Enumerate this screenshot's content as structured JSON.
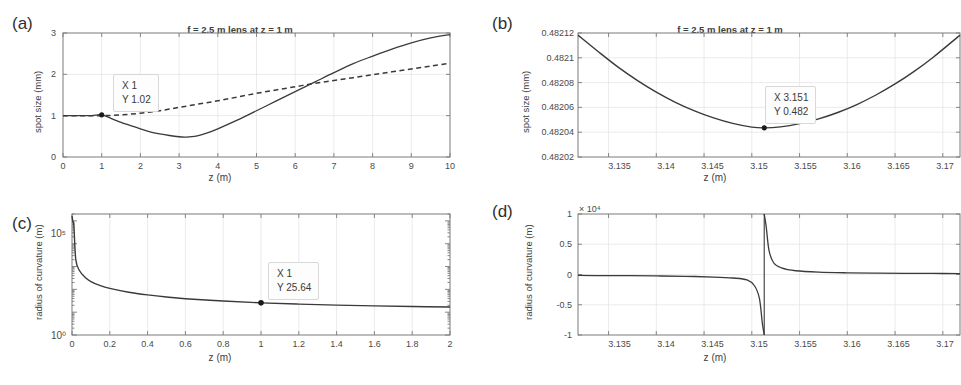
{
  "figure": {
    "panels": [
      {
        "id": "a",
        "label": "(a)",
        "title": "f = 2.5 m lens at z = 1 m",
        "xlabel": "z (m)",
        "ylabel": "spot size (mm)",
        "xticks": [
          "0",
          "1",
          "2",
          "3",
          "4",
          "5",
          "6",
          "7",
          "8",
          "9",
          "10"
        ],
        "yticks": [
          "0",
          "1",
          "2",
          "3"
        ],
        "datatip": {
          "x_line": "X 1",
          "y_line": "Y 1.02"
        }
      },
      {
        "id": "b",
        "label": "(b)",
        "title": "f = 2.5 m lens at z = 1 m",
        "xlabel": "z (m)",
        "ylabel": "spot size (mm)",
        "xticks": [
          "3.135",
          "3.14",
          "3.145",
          "3.15",
          "3.155",
          "3.16",
          "3.165",
          "3.17"
        ],
        "yticks": [
          "0.48202",
          "0.48204",
          "0.48206",
          "0.48208",
          "0.4821",
          "0.48212"
        ],
        "datatip": {
          "x_line": "X 3.151",
          "y_line": "Y 0.482"
        }
      },
      {
        "id": "c",
        "label": "(c)",
        "title": "",
        "xlabel": "z (m)",
        "ylabel": "radius of curvature (m)",
        "xticks": [
          "0",
          "0.2",
          "0.4",
          "0.6",
          "0.8",
          "1",
          "1.2",
          "1.4",
          "1.6",
          "1.8",
          "2"
        ],
        "yticks": [
          "10⁰",
          "10⁵"
        ],
        "datatip": {
          "x_line": "X 1",
          "y_line": "Y 25.64"
        }
      },
      {
        "id": "d",
        "label": "(d)",
        "title": "",
        "xlabel": "z (m)",
        "ylabel": "radius of curvature (m)",
        "xticks": [
          "3.135",
          "3.14",
          "3.145",
          "3.15",
          "3.155",
          "3.16",
          "3.165",
          "3.17"
        ],
        "yticks": [
          "-1",
          "-0.5",
          "0",
          "0.5",
          "1"
        ],
        "exponent": "× 10⁴",
        "datatip": null
      }
    ]
  },
  "chart_data": [
    {
      "type": "line",
      "panel": "a",
      "title": "f = 2.5 m lens at z = 1 m",
      "xlabel": "z (m)",
      "ylabel": "spot size (mm)",
      "xlim": [
        0,
        10
      ],
      "ylim": [
        0,
        3
      ],
      "xticks": [
        0,
        1,
        2,
        3,
        4,
        5,
        6,
        7,
        8,
        9,
        10
      ],
      "yticks": [
        0,
        1,
        2,
        3
      ],
      "grid": true,
      "legend": null,
      "annotations": [
        {
          "text": "X 1 / Y 1.02",
          "x": 1,
          "y": 1.02,
          "marker": true
        }
      ],
      "series": [
        {
          "name": "focused beam (with lens)",
          "style": "solid",
          "x": [
            0,
            0.25,
            0.5,
            0.75,
            1.0,
            1.25,
            1.5,
            1.75,
            2.0,
            2.25,
            2.5,
            2.75,
            3.0,
            3.151,
            3.25,
            3.5,
            3.75,
            4.0,
            4.5,
            5.0,
            5.5,
            6.0,
            6.5,
            7.0,
            7.5,
            8.0,
            8.5,
            9.0,
            9.5,
            10.0
          ],
          "y": [
            1.0,
            1.0,
            1.0,
            1.0,
            1.02,
            0.93,
            0.84,
            0.76,
            0.68,
            0.61,
            0.56,
            0.52,
            0.49,
            0.482,
            0.485,
            0.52,
            0.59,
            0.68,
            0.89,
            1.12,
            1.35,
            1.58,
            1.81,
            2.04,
            2.26,
            2.44,
            2.61,
            2.76,
            2.88,
            2.96
          ]
        },
        {
          "name": "free propagation (no lens)",
          "style": "dashed",
          "x": [
            0,
            0.5,
            1.0,
            1.5,
            2.0,
            2.5,
            3.0,
            3.5,
            4.0,
            4.5,
            5.0,
            5.5,
            6.0,
            6.5,
            7.0,
            7.5,
            8.0,
            8.5,
            9.0,
            9.5,
            10.0
          ],
          "y": [
            1.0,
            1.0,
            1.0,
            1.02,
            1.06,
            1.12,
            1.2,
            1.28,
            1.36,
            1.45,
            1.54,
            1.62,
            1.7,
            1.78,
            1.85,
            1.92,
            1.99,
            2.06,
            2.13,
            2.2,
            2.27
          ]
        }
      ]
    },
    {
      "type": "line",
      "panel": "b",
      "title": "f = 2.5 m lens at z = 1 m",
      "xlabel": "z (m)",
      "ylabel": "spot size (mm)",
      "xlim": [
        3.1318,
        3.1718
      ],
      "ylim": [
        0.48202,
        0.48212
      ],
      "xticks": [
        3.135,
        3.14,
        3.145,
        3.15,
        3.155,
        3.16,
        3.165,
        3.17
      ],
      "yticks": [
        0.48202,
        0.48204,
        0.48206,
        0.48208,
        0.4821,
        0.48212
      ],
      "grid": true,
      "legend": null,
      "annotations": [
        {
          "text": "X 3.151 / Y 0.482",
          "x": 3.1513,
          "y": 0.4820435,
          "marker": true
        }
      ],
      "series": [
        {
          "name": "spot size near waist",
          "style": "solid",
          "x": [
            3.1318,
            3.134,
            3.136,
            3.138,
            3.14,
            3.142,
            3.144,
            3.146,
            3.148,
            3.15,
            3.1513,
            3.153,
            3.155,
            3.157,
            3.159,
            3.161,
            3.163,
            3.165,
            3.167,
            3.169,
            3.1718
          ],
          "y": [
            0.4821183,
            0.4821045,
            0.4820925,
            0.4820818,
            0.4820723,
            0.4820641,
            0.4820572,
            0.4820515,
            0.4820471,
            0.4820441,
            0.4820435,
            0.4820443,
            0.4820469,
            0.4820508,
            0.4820559,
            0.4820623,
            0.48207,
            0.4820789,
            0.4820891,
            0.4821005,
            0.4821183
          ]
        }
      ]
    },
    {
      "type": "line",
      "panel": "c",
      "title": "",
      "xlabel": "z (m)",
      "ylabel": "radius of curvature (m)",
      "xlim": [
        0,
        2
      ],
      "ylim": [
        1,
        200000
      ],
      "yscale": "log",
      "xticks": [
        0,
        0.2,
        0.4,
        0.6,
        0.8,
        1,
        1.2,
        1.4,
        1.6,
        1.8,
        2
      ],
      "yticks": [
        1,
        100000
      ],
      "ytick_labels": [
        "10^0",
        "10^5"
      ],
      "grid": true,
      "legend": null,
      "annotations": [
        {
          "text": "X 1 / Y 25.64",
          "x": 1,
          "y": 25.64,
          "marker": true
        }
      ],
      "series": [
        {
          "name": "radius of curvature vs z",
          "style": "solid",
          "x": [
            0.0005,
            0.002,
            0.005,
            0.01,
            0.02,
            0.04,
            0.07,
            0.1,
            0.15,
            0.2,
            0.3,
            0.4,
            0.5,
            0.6,
            0.8,
            1.0,
            1.2,
            1.4,
            1.6,
            1.8,
            2.0
          ],
          "y": [
            160000,
            130000,
            90000,
            60000,
            2000,
            650,
            330,
            220,
            145,
            110,
            75,
            57,
            46,
            39,
            31,
            25.64,
            22.5,
            20.3,
            18.8,
            17.7,
            16.9
          ]
        }
      ]
    },
    {
      "type": "line",
      "panel": "d",
      "title": "",
      "xlabel": "z (m)",
      "ylabel": "radius of curvature (m)",
      "xlim": [
        3.1318,
        3.1718
      ],
      "ylim": [
        -10000,
        10000
      ],
      "y_exponent": "x 10^4",
      "xticks": [
        3.135,
        3.14,
        3.145,
        3.15,
        3.155,
        3.16,
        3.165,
        3.17
      ],
      "yticks": [
        -10000,
        -5000,
        0,
        5000,
        10000
      ],
      "grid": true,
      "legend": null,
      "asymptote_x": 3.1513,
      "annotations": [],
      "series": [
        {
          "name": "radius of curvature near waist",
          "style": "solid",
          "x": [
            3.1318,
            3.134,
            3.137,
            3.14,
            3.143,
            3.146,
            3.148,
            3.1495,
            3.1503,
            3.1508,
            3.1511,
            3.1513,
            3.1515,
            3.1518,
            3.1523,
            3.1531,
            3.1546,
            3.157,
            3.16,
            3.163,
            3.166,
            3.169,
            3.1718
          ],
          "y": [
            -160,
            -175,
            -200,
            -240,
            -300,
            -420,
            -580,
            -900,
            -1900,
            -4000,
            -8000,
            -99999,
            8000,
            4000,
            1900,
            1100,
            620,
            390,
            280,
            225,
            195,
            175,
            160
          ]
        }
      ]
    }
  ]
}
